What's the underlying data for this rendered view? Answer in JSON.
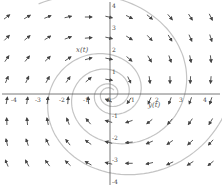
{
  "chart_data": {
    "type": "vector_field",
    "title": "",
    "xlabel": "",
    "ylabel": "",
    "xlim": [
      -4.5,
      4.5
    ],
    "ylim": [
      -4.5,
      4.5
    ],
    "x_ticks": [
      "-4",
      "-3",
      "-2",
      "-1",
      "0",
      "1",
      "2",
      "3",
      "4"
    ],
    "y_ticks": [
      "4",
      "3",
      "2",
      "1",
      "-1",
      "-2",
      "-3",
      "-4"
    ],
    "grid": false,
    "annotations": [
      {
        "text": "x(t)",
        "x": -1.2,
        "y": 1.8
      },
      {
        "text": "y(t)",
        "x": 1.9,
        "y": -0.3
      }
    ],
    "field": "spiral around origin: dx/dt = -y - 0.3x, dy/dt = x - 0.3y (clockwise-looking flow in screen coords)",
    "solution_curves": 2,
    "colors": {
      "arrow": "#444444",
      "axis": "#555555",
      "curve": "#bbbbbb"
    }
  }
}
